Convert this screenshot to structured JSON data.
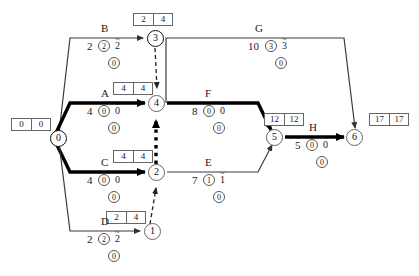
{
  "diagram": {
    "type": "aoa-network",
    "colors": {
      "critical_path": "#000000",
      "normal_path": "#555555",
      "box_border": "#666666",
      "background": "#ffffff"
    }
  },
  "nodes": [
    {
      "id": "node-0",
      "label": "0",
      "early": "0",
      "late": "0",
      "critical": true
    },
    {
      "id": "node-1",
      "label": "1",
      "early": "2",
      "late": "4",
      "critical": false
    },
    {
      "id": "node-2",
      "label": "2",
      "early": "4",
      "late": "4",
      "critical": true
    },
    {
      "id": "node-3",
      "label": "3",
      "early": "2",
      "late": "4",
      "critical": false
    },
    {
      "id": "node-4",
      "label": "4",
      "early": "4",
      "late": "4",
      "critical": true
    },
    {
      "id": "node-5",
      "label": "5",
      "early": "12",
      "late": "12",
      "critical": true
    },
    {
      "id": "node-6",
      "label": "6",
      "early": "17",
      "late": "17",
      "critical": true
    }
  ],
  "activities": [
    {
      "id": "act-B",
      "name": "B",
      "duration": "2",
      "total_float": "2",
      "free_float": "2",
      "independent_float": "0",
      "critical": false
    },
    {
      "id": "act-G",
      "name": "G",
      "duration": "10",
      "total_float": "3",
      "free_float": "3",
      "independent_float": "0",
      "critical": false
    },
    {
      "id": "act-A",
      "name": "A",
      "duration": "4",
      "total_float": "0",
      "free_float": "0",
      "independent_float": "0",
      "critical": true
    },
    {
      "id": "act-F",
      "name": "F",
      "duration": "8",
      "total_float": "0",
      "free_float": "0",
      "independent_float": "0",
      "critical": true
    },
    {
      "id": "act-H",
      "name": "H",
      "duration": "5",
      "total_float": "0",
      "free_float": "0",
      "independent_float": "0",
      "critical": true
    },
    {
      "id": "act-C",
      "name": "C",
      "duration": "4",
      "total_float": "0",
      "free_float": "0",
      "independent_float": "0",
      "critical": true
    },
    {
      "id": "act-E",
      "name": "E",
      "duration": "7",
      "total_float": "1",
      "free_float": "1",
      "independent_float": "0",
      "critical": false
    },
    {
      "id": "act-D",
      "name": "D",
      "duration": "2",
      "total_float": "2",
      "free_float": "2",
      "independent_float": "0",
      "critical": false
    }
  ],
  "dummies": [
    {
      "id": "dummy-3-4",
      "from": "3",
      "to": "4",
      "style": "dashed",
      "critical": false
    },
    {
      "id": "dummy-2-4",
      "from": "2",
      "to": "4",
      "style": "dotted-thick",
      "critical": true
    },
    {
      "id": "dummy-1-2",
      "from": "1",
      "to": "2",
      "style": "dashed",
      "critical": false
    }
  ]
}
